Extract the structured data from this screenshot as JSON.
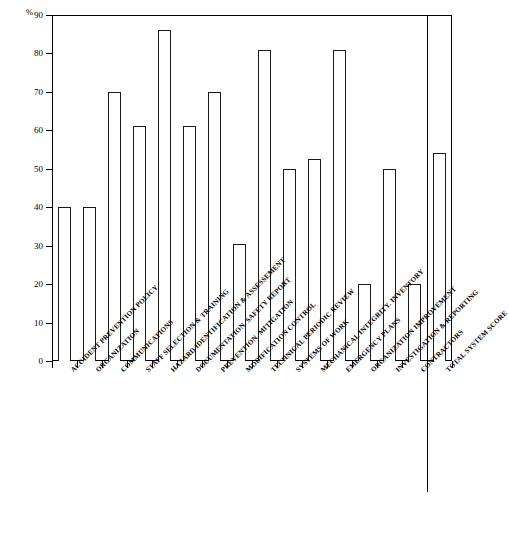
{
  "chart_data": {
    "type": "bar",
    "title": "",
    "xlabel": "",
    "ylabel": "%",
    "ylim": [
      0,
      90
    ],
    "ytick_step": 10,
    "yticks": [
      "0",
      "10",
      "20",
      "30",
      "40",
      "50",
      "60",
      "70",
      "80",
      "90"
    ],
    "grid": false,
    "legend": null,
    "bar_style": {
      "fill": "#ffffff",
      "edge": "#1a1a1a",
      "edge_width_px": 1.3
    },
    "background_color": "#ffffff",
    "separator_before_last_category": true,
    "categories": [
      "ACCIDENT PREVENTION POLICY",
      "ORGANIZATION",
      "COMMUNICATIONS",
      "STAFF SELECTION & TRAINING",
      "HAZARD IDENTIFICATION & ASSESSEMENT",
      "DOCUMENTATION. SAFETY REPORT",
      "PREVENTION. MITIGATION",
      "MODIFICATION CONTROL",
      "TECHNICAL PERIODIC REVIEW",
      "SYSTEMS OF WORK",
      "MECHANICAL INTEGRITY. INVENTORY",
      "EMERGENCY PLANS",
      "ORGANIZATION IMPROVEMENT",
      "INVESTIGATION & REPORTING",
      "CONTRACTORS",
      "TOTAL SYSTEM SCORE"
    ],
    "values": [
      40,
      40,
      70,
      61,
      86,
      61,
      70,
      30.5,
      81,
      50,
      52.5,
      81,
      20,
      50,
      20,
      54
    ]
  }
}
